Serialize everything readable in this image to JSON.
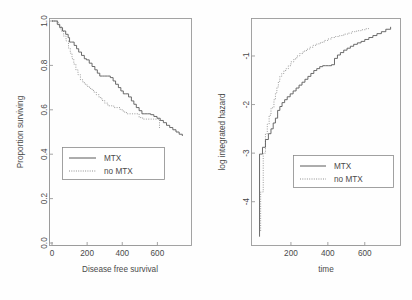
{
  "figure": {
    "background": "#fefefe",
    "axis_color": "#9a9a9a",
    "solid_color": "#5a5a5a",
    "dotted_color": "#8f8f8f",
    "panels": 2
  },
  "chart_data": [
    {
      "id": "left",
      "type": "line",
      "subtype": "kaplan-meier-step",
      "title": "",
      "xlabel": "Disease free survival",
      "ylabel": "Proportion surviving",
      "xlim": [
        0,
        780
      ],
      "ylim": [
        0.0,
        1.0
      ],
      "xticks": [
        0,
        200,
        400,
        600
      ],
      "xticklabels": [
        "0",
        "200",
        "400",
        "600"
      ],
      "yticks": [
        0.0,
        0.2,
        0.4,
        0.6,
        0.8,
        1.0
      ],
      "yticklabels": [
        "0.0",
        "0.2",
        "0.4",
        "0.6",
        "0.8",
        "1.0"
      ],
      "grid": false,
      "legend": {
        "position": "center-left",
        "entries": [
          {
            "label": "MTX",
            "style": "solid"
          },
          {
            "label": "no MTX",
            "style": "dotted"
          }
        ]
      },
      "series": [
        {
          "name": "MTX",
          "style": "solid",
          "x": [
            0,
            18,
            30,
            44,
            60,
            78,
            92,
            100,
            112,
            126,
            140,
            152,
            168,
            184,
            196,
            212,
            228,
            244,
            258,
            272,
            288,
            300,
            316,
            332,
            348,
            362,
            378,
            392,
            406,
            420,
            436,
            452,
            466,
            480,
            496,
            512,
            528,
            544,
            562,
            580,
            598,
            616,
            634,
            652,
            670,
            688,
            706,
            724,
            742
          ],
          "y": [
            1.0,
            1.0,
            0.985,
            0.97,
            0.955,
            0.94,
            0.925,
            0.905,
            0.905,
            0.89,
            0.875,
            0.86,
            0.845,
            0.83,
            0.825,
            0.81,
            0.795,
            0.78,
            0.765,
            0.752,
            0.752,
            0.752,
            0.752,
            0.745,
            0.73,
            0.715,
            0.7,
            0.685,
            0.672,
            0.672,
            0.658,
            0.64,
            0.625,
            0.61,
            0.596,
            0.582,
            0.582,
            0.582,
            0.578,
            0.57,
            0.562,
            0.552,
            0.542,
            0.53,
            0.52,
            0.51,
            0.5,
            0.49,
            0.482
          ]
        },
        {
          "name": "no MTX",
          "style": "dotted",
          "x": [
            0,
            20,
            36,
            52,
            66,
            80,
            94,
            104,
            114,
            124,
            136,
            148,
            162,
            176,
            190,
            204,
            220,
            236,
            252,
            268,
            284,
            300,
            318,
            336,
            352,
            370,
            388,
            406,
            424,
            442,
            460,
            478,
            496,
            516,
            536,
            556,
            576,
            596,
            612
          ],
          "y": [
            1.0,
            1.0,
            0.978,
            0.955,
            0.932,
            0.91,
            0.878,
            0.855,
            0.83,
            0.806,
            0.78,
            0.758,
            0.735,
            0.722,
            0.712,
            0.702,
            0.692,
            0.68,
            0.668,
            0.655,
            0.642,
            0.63,
            0.618,
            0.618,
            0.61,
            0.61,
            0.6,
            0.59,
            0.582,
            0.582,
            0.582,
            0.582,
            0.565,
            0.558,
            0.558,
            0.558,
            0.558,
            0.558,
            0.518
          ]
        }
      ]
    },
    {
      "id": "right",
      "type": "line",
      "subtype": "log-cumulative-hazard-step",
      "title": "",
      "xlabel": "time",
      "ylabel": "log integrated hazard",
      "xlim": [
        0,
        780
      ],
      "ylim": [
        -4.85,
        -0.28
      ],
      "xticks": [
        200,
        400,
        600
      ],
      "xticklabels": [
        "200",
        "400",
        "600"
      ],
      "yticks": [
        -1,
        -2,
        -3,
        -4
      ],
      "yticklabels": [
        "-1",
        "-2",
        "-3",
        "-4"
      ],
      "grid": false,
      "legend": {
        "position": "center",
        "entries": [
          {
            "label": "MTX",
            "style": "solid"
          },
          {
            "label": "no MTX",
            "style": "dotted"
          }
        ]
      },
      "series": [
        {
          "name": "MTX",
          "style": "solid",
          "x": [
            30,
            30,
            46,
            46,
            62,
            78,
            92,
            104,
            116,
            128,
            140,
            152,
            166,
            180,
            196,
            212,
            228,
            244,
            260,
            276,
            292,
            308,
            324,
            340,
            356,
            372,
            388,
            404,
            420,
            436,
            452,
            468,
            486,
            504,
            522,
            540,
            560,
            580,
            600,
            622,
            644,
            666,
            690,
            714,
            740
          ],
          "y": [
            -4.72,
            -3.02,
            -3.02,
            -2.88,
            -2.72,
            -2.6,
            -2.5,
            -2.38,
            -2.28,
            -2.12,
            -2.04,
            -1.96,
            -1.9,
            -1.84,
            -1.78,
            -1.72,
            -1.66,
            -1.6,
            -1.54,
            -1.48,
            -1.42,
            -1.36,
            -1.3,
            -1.26,
            -1.22,
            -1.2,
            -1.2,
            -1.2,
            -1.18,
            -1.05,
            -0.98,
            -0.93,
            -0.88,
            -0.84,
            -0.8,
            -0.76,
            -0.73,
            -0.7,
            -0.66,
            -0.62,
            -0.58,
            -0.54,
            -0.5,
            -0.45,
            -0.4
          ]
        },
        {
          "name": "no MTX",
          "style": "dotted",
          "x": [
            36,
            36,
            50,
            50,
            62,
            72,
            82,
            92,
            100,
            108,
            116,
            124,
            132,
            140,
            150,
            162,
            174,
            186,
            200,
            216,
            232,
            248,
            266,
            284,
            302,
            320,
            340,
            360,
            380,
            400,
            420,
            442,
            464,
            486,
            508,
            532,
            556,
            580,
            606,
            620
          ],
          "y": [
            -4.6,
            -3.8,
            -3.8,
            -3.0,
            -2.6,
            -2.4,
            -2.22,
            -2.08,
            -2.06,
            -1.9,
            -1.76,
            -1.64,
            -1.52,
            -1.42,
            -1.36,
            -1.3,
            -1.26,
            -1.2,
            -1.12,
            -1.06,
            -1.0,
            -0.95,
            -0.9,
            -0.86,
            -0.82,
            -0.78,
            -0.75,
            -0.72,
            -0.68,
            -0.65,
            -0.62,
            -0.6,
            -0.58,
            -0.55,
            -0.53,
            -0.5,
            -0.48,
            -0.46,
            -0.44,
            -0.4
          ]
        }
      ]
    }
  ]
}
